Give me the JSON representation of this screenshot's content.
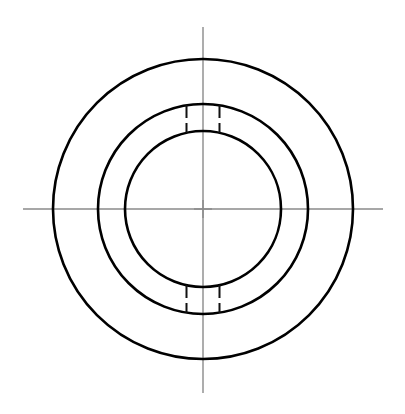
{
  "document": {
    "title": "Orthographic front view - annular flange with keyways",
    "background_color": "#ffffff",
    "width": 405,
    "height": 414
  },
  "style": {
    "object_line_color": "#000000",
    "object_line_width": 2.6,
    "center_line_color": "#8a8a8a",
    "center_line_width": 1.4,
    "hidden_line_color": "#111111",
    "hidden_line_width": 2.0,
    "hidden_dash_pattern": "13 5"
  },
  "geometry": {
    "center": {
      "x": 203,
      "y": 209
    },
    "circles": [
      {
        "name": "outer-circle",
        "role": "outside-diameter",
        "radius": 150,
        "diameter": 300
      },
      {
        "name": "middle-circle",
        "role": "hub-diameter",
        "radius": 105,
        "diameter": 210
      },
      {
        "name": "inner-circle",
        "role": "bore-diameter",
        "radius": 78,
        "diameter": 156
      }
    ],
    "center_lines": {
      "horizontal": {
        "x1": 23,
        "y1": 209,
        "x2": 383,
        "y2": 209
      },
      "vertical": {
        "x1": 203,
        "y1": 27,
        "x2": 203,
        "y2": 393
      }
    },
    "center_mark": {
      "arm_length": 9,
      "horizontal": {
        "x1": 194,
        "y1": 209,
        "x2": 212,
        "y2": 209
      },
      "vertical": {
        "x1": 203,
        "y1": 200,
        "x2": 203,
        "y2": 218
      }
    },
    "keyways": [
      {
        "name": "keyway-top",
        "position": "top",
        "width": 33,
        "lines": [
          {
            "x1": 186.5,
            "y1": 105,
            "x2": 186.5,
            "y2": 133
          },
          {
            "x1": 219.5,
            "y1": 105,
            "x2": 219.5,
            "y2": 133
          }
        ]
      },
      {
        "name": "keyway-bottom",
        "position": "bottom",
        "width": 33,
        "lines": [
          {
            "x1": 186.5,
            "y1": 285,
            "x2": 186.5,
            "y2": 313
          },
          {
            "x1": 219.5,
            "y1": 285,
            "x2": 219.5,
            "y2": 313
          }
        ]
      }
    ]
  }
}
